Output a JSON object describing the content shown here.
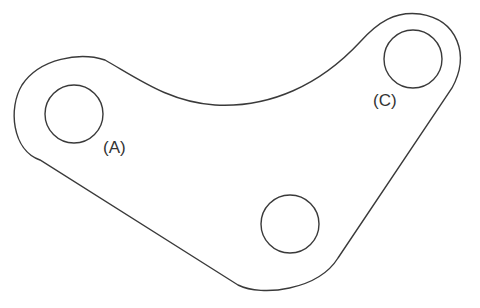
{
  "diagram": {
    "stroke_color": "#3a3a3a",
    "background": "#ffffff",
    "holes": [
      {
        "id": "A",
        "label": "(A)",
        "cx": 74,
        "cy": 114,
        "r": 29
      },
      {
        "id": "C",
        "label": "(C)",
        "cx": 413,
        "cy": 59,
        "r": 29
      },
      {
        "id": "B",
        "label": "",
        "cx": 290,
        "cy": 224,
        "r": 29
      }
    ],
    "labels": [
      {
        "text": "(A)",
        "x": 103,
        "y": 153
      },
      {
        "text": "(C)",
        "x": 373,
        "y": 106
      }
    ]
  }
}
